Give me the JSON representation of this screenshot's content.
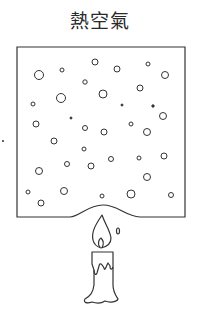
{
  "title": "熱空氣",
  "colors": {
    "stroke": "#333333",
    "background": "#ffffff"
  },
  "box": {
    "x1": 17,
    "y1": 47,
    "x2": 185,
    "y2": 217,
    "bulge_from": 70,
    "bulge_to": 140,
    "bulge_peak_y": 205
  },
  "particles": [
    {
      "x": 39,
      "y": 75,
      "r": 4.5
    },
    {
      "x": 62,
      "y": 70,
      "r": 2
    },
    {
      "x": 95,
      "y": 62,
      "r": 3
    },
    {
      "x": 117,
      "y": 69,
      "r": 3
    },
    {
      "x": 148,
      "y": 64,
      "r": 2
    },
    {
      "x": 165,
      "y": 75,
      "r": 3.5
    },
    {
      "x": 85,
      "y": 82,
      "r": 2.2
    },
    {
      "x": 140,
      "y": 88,
      "r": 3
    },
    {
      "x": 61,
      "y": 98,
      "r": 4.5
    },
    {
      "x": 103,
      "y": 94,
      "r": 4
    },
    {
      "x": 33,
      "y": 104,
      "r": 2
    },
    {
      "x": 122,
      "y": 105,
      "r": 1,
      "fill": true
    },
    {
      "x": 153,
      "y": 106,
      "r": 1.2,
      "fill": true
    },
    {
      "x": 71,
      "y": 118,
      "r": 1,
      "fill": true
    },
    {
      "x": 36,
      "y": 124,
      "r": 3
    },
    {
      "x": 163,
      "y": 116,
      "r": 3.5
    },
    {
      "x": 85,
      "y": 128,
      "r": 2.5
    },
    {
      "x": 104,
      "y": 132,
      "r": 3
    },
    {
      "x": 131,
      "y": 124,
      "r": 2
    },
    {
      "x": 147,
      "y": 132,
      "r": 3.5
    },
    {
      "x": 54,
      "y": 141,
      "r": 3
    },
    {
      "x": 84,
      "y": 149,
      "r": 2
    },
    {
      "x": 67,
      "y": 164,
      "r": 2.5
    },
    {
      "x": 91,
      "y": 166,
      "r": 3
    },
    {
      "x": 111,
      "y": 159,
      "r": 2.5
    },
    {
      "x": 139,
      "y": 158,
      "r": 2
    },
    {
      "x": 164,
      "y": 156,
      "r": 3
    },
    {
      "x": 39,
      "y": 171,
      "r": 3.5
    },
    {
      "x": 147,
      "y": 177,
      "r": 3.5
    },
    {
      "x": 28,
      "y": 192,
      "r": 2
    },
    {
      "x": 64,
      "y": 191,
      "r": 3.5
    },
    {
      "x": 102,
      "y": 196,
      "r": 2
    },
    {
      "x": 131,
      "y": 194,
      "r": 4
    },
    {
      "x": 171,
      "y": 195,
      "r": 2.5
    },
    {
      "x": 41,
      "y": 203,
      "r": 3
    }
  ],
  "stray_dot": {
    "x": 3,
    "y": 141
  },
  "candle": {
    "label": "candle"
  }
}
